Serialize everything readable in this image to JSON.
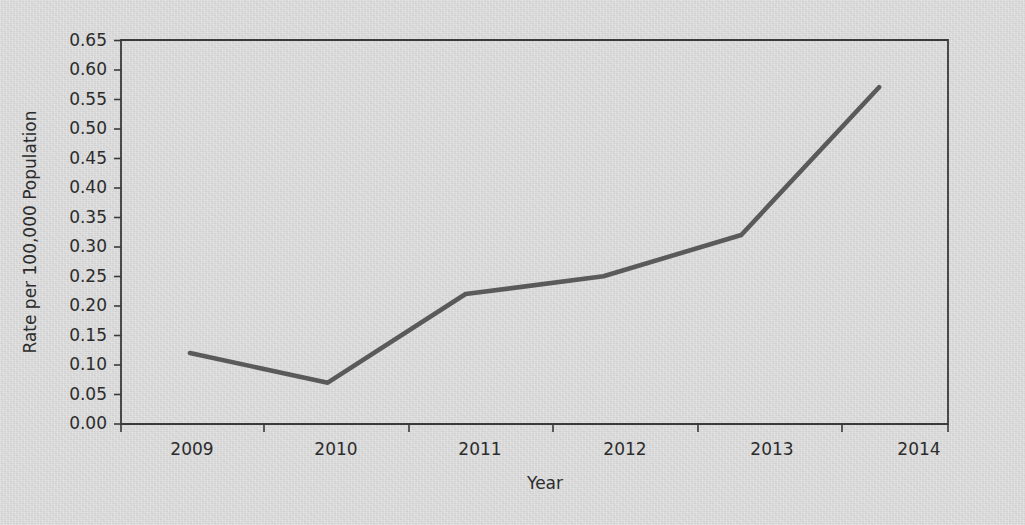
{
  "figure": {
    "background_color": "#dcdcdc",
    "line_color": "#5a5a5a",
    "axis_color": "#3a3a3a",
    "text_color": "#2c2c2c"
  },
  "axes": {
    "y_title": "Rate per 100,000 Population",
    "x_title": "Year"
  },
  "chart_data": {
    "type": "line",
    "title": "",
    "xlabel": "Year",
    "ylabel": "Rate per 100,000 Population",
    "categories": [
      "2009",
      "2010",
      "2011",
      "2012",
      "2013",
      "2014"
    ],
    "values": [
      0.12,
      0.07,
      0.22,
      0.25,
      0.32,
      0.57
    ],
    "series": [
      {
        "name": "Rate",
        "values": [
          0.12,
          0.07,
          0.22,
          0.25,
          0.32,
          0.57
        ]
      }
    ],
    "ylim": [
      0.0,
      0.65
    ],
    "ytick_labels": [
      "0.00",
      "0.05",
      "0.10",
      "0.15",
      "0.20",
      "0.25",
      "0.30",
      "0.35",
      "0.40",
      "0.45",
      "0.50",
      "0.55",
      "0.60",
      "0.65"
    ],
    "ytick_values": [
      0.0,
      0.05,
      0.1,
      0.15,
      0.2,
      0.25,
      0.3,
      0.35,
      0.4,
      0.45,
      0.5,
      0.55,
      0.6,
      0.65
    ],
    "xtick_labels": [
      "2009",
      "2010",
      "2011",
      "2012",
      "2013",
      "2014"
    ],
    "grid": false,
    "legend": false,
    "legend_position": "none",
    "marker": "none",
    "annotations": []
  }
}
